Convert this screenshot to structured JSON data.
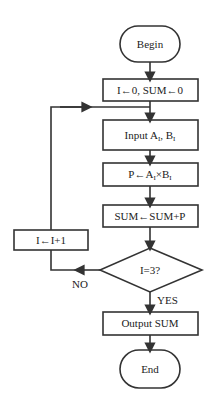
{
  "flowchart": {
    "begin": "Begin",
    "init": "I←0, SUM←0",
    "input": {
      "prefix": "Input A",
      "sub1": "I",
      "mid": ", B",
      "sub2": "I"
    },
    "product": {
      "prefix": "P←A",
      "sub1": "I",
      "mid": "×B",
      "sub2": "I"
    },
    "accumulate": "SUM←SUM+P",
    "decision": "I=3?",
    "increment": "I←I+1",
    "no_label": "NO",
    "yes_label": "YES",
    "output": "Output SUM",
    "end": "End"
  },
  "colors": {
    "stroke": "#333333",
    "background": "#ffffff"
  }
}
